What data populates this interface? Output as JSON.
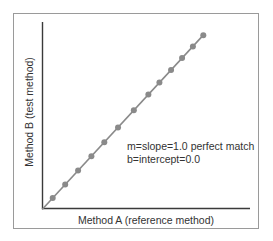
{
  "chart_data": {
    "type": "line",
    "title": "",
    "xlabel": "Method A (reference method)",
    "ylabel": "Method B (test method)",
    "xlim": [
      0,
      100
    ],
    "ylim": [
      0,
      100
    ],
    "grid": false,
    "legend": null,
    "ticks": "none",
    "series": [
      {
        "name": "Method B vs Method A",
        "style": "line with markers",
        "color": "#8a8a8a",
        "x": [
          5.1,
          11.1,
          17.3,
          23.7,
          29.9,
          36.5,
          44.1,
          51.1,
          56.4,
          62.0,
          67.3,
          72.5,
          77.5
        ],
        "y": [
          5.1,
          11.1,
          17.3,
          23.7,
          29.9,
          36.5,
          44.1,
          51.1,
          56.4,
          62.0,
          67.3,
          72.5,
          77.5
        ]
      }
    ],
    "line": {
      "x_start": 0,
      "y_start": 0,
      "x_end": 77.5,
      "y_end": 77.5
    },
    "annotations": [
      {
        "text": "m=slope=1.0 perfect match",
        "x": 39.5,
        "y": 29
      },
      {
        "text": "b=intercept=0.0",
        "x": 39.5,
        "y": 23
      }
    ]
  },
  "labels": {
    "x_axis": "Method A (reference method)",
    "y_axis": "Method B (test method)",
    "annotation_line1": "m=slope=1.0 perfect match",
    "annotation_line2": "b=intercept=0.0"
  },
  "colors": {
    "axis": "#3a3a3a",
    "series": "#8a8a8a",
    "frame": "#9a9a9a",
    "text": "#333333"
  }
}
